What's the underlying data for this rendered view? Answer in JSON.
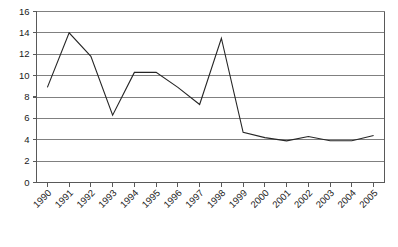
{
  "chart_data": {
    "type": "line",
    "title": "",
    "subtitle": "",
    "xlabel": "",
    "ylabel": "",
    "categories": [
      "1990",
      "1991",
      "1992",
      "1993",
      "1994",
      "1995",
      "1996",
      "1997",
      "1998",
      "1999",
      "2000",
      "2001",
      "2002",
      "2003",
      "2004",
      "2005"
    ],
    "values": [
      8.9,
      14.0,
      11.8,
      6.3,
      10.3,
      10.3,
      8.9,
      7.3,
      13.5,
      4.7,
      4.2,
      3.9,
      4.3,
      3.9,
      3.9,
      4.4
    ],
    "series": [
      {
        "name": "",
        "values": [
          8.9,
          14.0,
          11.8,
          6.3,
          10.3,
          10.3,
          8.9,
          7.3,
          13.5,
          4.7,
          4.2,
          3.9,
          4.3,
          3.9,
          3.9,
          4.4
        ]
      }
    ],
    "ylim": [
      0,
      16
    ],
    "yticks": [
      0,
      2,
      4,
      6,
      8,
      10,
      12,
      14,
      16
    ],
    "ytick_labels": [
      "0",
      "2",
      "4",
      "6",
      "8",
      "10",
      "12",
      "14",
      "16"
    ],
    "xtick_labels": [
      "1990",
      "1991",
      "1992",
      "1993",
      "1994",
      "1995",
      "1996",
      "1997",
      "1998",
      "1999",
      "2000",
      "2001",
      "2002",
      "2003",
      "2004",
      "2005"
    ],
    "grid": true,
    "grid_axis": "y",
    "legend": false,
    "legend_position": "none",
    "markers": false,
    "annotations": [],
    "colors": {
      "line": "#262626",
      "grid": "#808080",
      "axis": "#595959",
      "background": "#ffffff",
      "tick_text": "#1a1a1a"
    },
    "xtick_label_rotation": -45
  }
}
